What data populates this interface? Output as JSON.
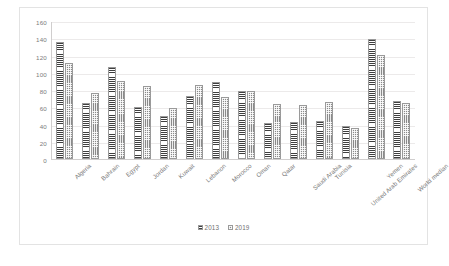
{
  "chart_data": {
    "type": "bar",
    "title": "",
    "subtitle": "",
    "xlabel": "",
    "ylabel": "",
    "ylim": [
      0,
      160
    ],
    "yticks": [
      0,
      20,
      40,
      60,
      80,
      100,
      120,
      140,
      160
    ],
    "grid": true,
    "legend_position": "bottom",
    "categories": [
      "Algeria",
      "Bahrain",
      "Egypt",
      "Jordan",
      "Kuwait",
      "Lebanon",
      "Morocco",
      "Oman",
      "Qatar",
      "Saudi Arabia",
      "Tunisia",
      "United Arab Emirates",
      "Yemen",
      "World median"
    ],
    "series": [
      {
        "name": "2013",
        "pattern": "horizontal-lines",
        "color": "#8d8d8d",
        "values": [
          137,
          66,
          107,
          61,
          50,
          74,
          90,
          80,
          42,
          43,
          44,
          38,
          140,
          68
        ]
      },
      {
        "name": "2019",
        "pattern": "dotted",
        "color": "#8a8a8a",
        "values": [
          112,
          77,
          91,
          85,
          59,
          87,
          73,
          80,
          64,
          63,
          67,
          36,
          122,
          65
        ]
      }
    ]
  },
  "legend": {
    "items": [
      {
        "label": "2013"
      },
      {
        "label": "2019"
      }
    ]
  }
}
